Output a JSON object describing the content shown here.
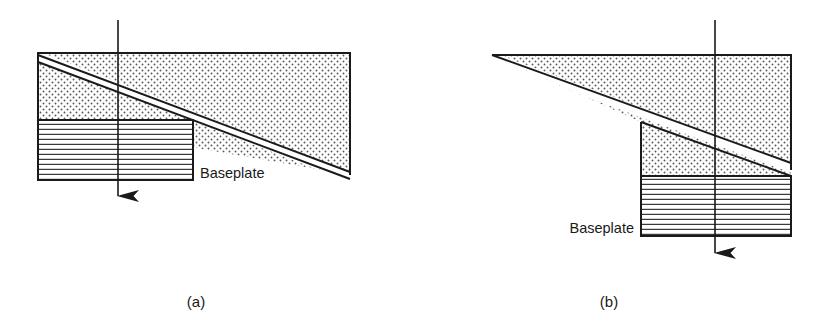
{
  "figure": {
    "title_visible": false,
    "background_color": "#ffffff",
    "line_color": "#1a1a1a",
    "stipple_color": "#4a4a4a",
    "hatch_color": "#3a3a3a"
  },
  "panels": [
    {
      "id": "a",
      "caption": "(a)",
      "caption_x": 196,
      "caption_y": 307,
      "baseplate_label": "Baseplate",
      "baseplate_label_x": 200,
      "baseplate_label_y": 178,
      "baseplate_label_anchor": "start",
      "wedge": {
        "fill_pattern": "stipple",
        "upper_points": "38,53 350,53 350,172 38,56",
        "lower_points": "38,62 350,180 350,175 38,59",
        "top_edge": "38,53 350,53",
        "left_edge": "38,53 38,120",
        "right_edge": "350,53 350,175",
        "diagonal_upper": "38,56 350,172",
        "diagonal_lower": "38,62 350,180"
      },
      "baseplate": {
        "fill_pattern": "horizontal-hatch",
        "x": 38,
        "y": 120,
        "width": 155,
        "height": 60,
        "hatch_count": 12
      },
      "arrow": {
        "x": 118,
        "y_start": 20,
        "y_end": 216,
        "direction": "down",
        "head_length": 20,
        "head_width": 11
      }
    },
    {
      "id": "b",
      "caption": "(b)",
      "caption_x": 609,
      "caption_y": 307,
      "baseplate_label": "Baseplate",
      "baseplate_label_x": 634,
      "baseplate_label_y": 233,
      "baseplate_label_anchor": "end",
      "wedge": {
        "fill_pattern": "stipple",
        "top_edge": "492,55 791,55",
        "right_edge": "791,55 791,170",
        "step_vertical": "641,122 641,176",
        "apex": "492,55",
        "diagonal_upper": "492,55 791,163",
        "diagonal_lower": "496,62 791,176"
      },
      "baseplate": {
        "fill_pattern": "horizontal-hatch",
        "x": 641,
        "y": 176,
        "width": 150,
        "height": 60,
        "hatch_count": 12
      },
      "arrow": {
        "x": 715,
        "y_start": 20,
        "y_end": 273,
        "direction": "down",
        "head_length": 20,
        "head_width": 11
      }
    }
  ]
}
